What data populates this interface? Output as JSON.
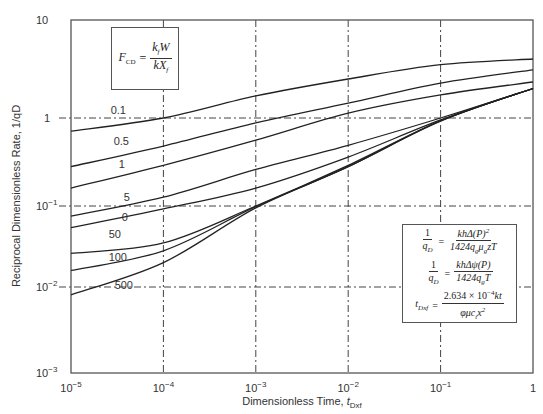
{
  "chart_data": {
    "type": "line",
    "title": "",
    "xlabel": "Dimensionless Time, t_Dxf",
    "xlabel_main": "Dimensionless Time, ",
    "xlabel_var": "t",
    "xlabel_sub": "Dxf",
    "ylabel": "Reciprocal Dimensionless Rate, 1/qD",
    "xscale": "log",
    "yscale": "log",
    "xlim": [
      1e-05,
      1
    ],
    "ylim": [
      0.001,
      10
    ],
    "grid": true,
    "x_ticks": [
      {
        "base": "10",
        "exp": "−5"
      },
      {
        "base": "10",
        "exp": "−4"
      },
      {
        "base": "10",
        "exp": "−3"
      },
      {
        "base": "10",
        "exp": "−2"
      },
      {
        "base": "10",
        "exp": "−1"
      },
      {
        "base": "1",
        "exp": ""
      }
    ],
    "y_ticks": [
      {
        "base": "10",
        "exp": ""
      },
      {
        "base": "1",
        "exp": ""
      },
      {
        "base": "10",
        "exp": "−1"
      },
      {
        "base": "10",
        "exp": "−2"
      },
      {
        "base": "10",
        "exp": "−3"
      }
    ],
    "x": [
      1e-05,
      0.0001,
      0.001,
      0.01,
      0.1,
      1
    ],
    "series": [
      {
        "name": "0.1",
        "label": "0.1",
        "values": [
          0.71,
          1.0,
          1.68,
          2.5,
          3.5,
          4.0
        ]
      },
      {
        "name": "0.5",
        "label": "0.5",
        "values": [
          0.28,
          0.48,
          0.88,
          1.42,
          2.27,
          3.1
        ]
      },
      {
        "name": "1",
        "label": "1",
        "values": [
          0.16,
          0.29,
          0.56,
          1.12,
          1.72,
          2.33
        ]
      },
      {
        "name": "5",
        "label": "5",
        "values": [
          0.075,
          0.126,
          0.26,
          0.49,
          1.0,
          2.0
        ]
      },
      {
        "name": "10",
        "label": "0",
        "values": [
          0.054,
          0.092,
          0.16,
          0.36,
          0.95,
          2.0
        ]
      },
      {
        "name": "50",
        "label": "50",
        "values": [
          0.026,
          0.035,
          0.1,
          0.29,
          0.93,
          2.0
        ]
      },
      {
        "name": "100",
        "label": "100",
        "values": [
          0.016,
          0.028,
          0.098,
          0.28,
          0.93,
          2.0
        ]
      },
      {
        "name": "500",
        "label": "500",
        "values": [
          0.0081,
          0.02,
          0.095,
          0.28,
          0.92,
          2.0
        ]
      }
    ],
    "annotations": {
      "fcd_box": {
        "lhs": "F",
        "lhs_sub": "CD",
        "num": "k",
        "num_sub": "f",
        "num_rest": "W",
        "den": "kX",
        "den_sub": "f"
      },
      "eq_box": {
        "eq1": {
          "lhs_num": "1",
          "lhs_den": "q",
          "lhs_den_sub": "D",
          "rhs_num": "khΔ(P)",
          "rhs_num_sup": "2",
          "rhs_den": "1424q",
          "rhs_den_sub1": "g",
          "rhs_den_mid": "μ",
          "rhs_den_sub2": "g",
          "rhs_den_rest": "zT"
        },
        "eq2": {
          "lhs_num": "1",
          "lhs_den": "q",
          "lhs_den_sub": "D",
          "rhs_num": "khΔψ(P)",
          "rhs_den": "1424q",
          "rhs_den_sub": "g",
          "rhs_den_rest": "T"
        },
        "eq3": {
          "lhs": "t",
          "lhs_sub": "Dxf",
          "rhs_num": "2.634 × 10",
          "rhs_num_sup": "−4",
          "rhs_num_rest": "kt",
          "rhs_den": "φμc",
          "rhs_den_sub": "t",
          "rhs_den_rest": "x",
          "rhs_den_sup": "2",
          "rhs_den_sub2": "f"
        }
      }
    }
  }
}
